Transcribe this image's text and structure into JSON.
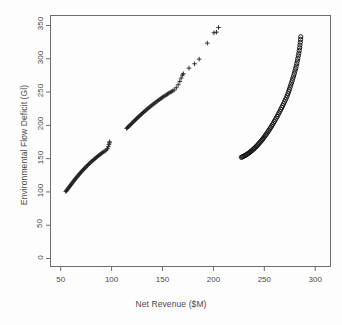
{
  "chart_data": {
    "type": "scatter",
    "title": "",
    "xlabel": "Net Revenue ($M)",
    "ylabel": "Environmental Flow Deficit (Gl)",
    "xlim": [
      40,
      315
    ],
    "ylim": [
      -12,
      365
    ],
    "xticks": [
      50,
      100,
      150,
      200,
      250,
      300
    ],
    "yticks": [
      0,
      50,
      100,
      150,
      200,
      250,
      300,
      350
    ],
    "grid": false,
    "legend": null,
    "box": true,
    "series": [
      {
        "name": "lower-left-front",
        "marker": "plus",
        "color": "#202020",
        "points": [
          [
            55.0,
            100.5
          ],
          [
            55.6,
            101.8
          ],
          [
            56.2,
            103.0
          ],
          [
            56.9,
            104.3
          ],
          [
            57.5,
            105.6
          ],
          [
            58.1,
            106.9
          ],
          [
            58.8,
            108.2
          ],
          [
            59.4,
            109.5
          ],
          [
            60.0,
            110.8
          ],
          [
            60.7,
            112.1
          ],
          [
            61.3,
            113.4
          ],
          [
            62.0,
            114.7
          ],
          [
            62.6,
            116.0
          ],
          [
            63.3,
            117.3
          ],
          [
            63.9,
            118.6
          ],
          [
            64.6,
            119.9
          ],
          [
            65.3,
            121.2
          ],
          [
            66.0,
            122.5
          ],
          [
            66.7,
            123.8
          ],
          [
            67.4,
            125.0
          ],
          [
            68.1,
            126.3
          ],
          [
            68.8,
            127.5
          ],
          [
            69.5,
            128.8
          ],
          [
            70.2,
            130.0
          ],
          [
            71.0,
            131.3
          ],
          [
            71.7,
            132.5
          ],
          [
            72.5,
            133.8
          ],
          [
            73.2,
            135.0
          ],
          [
            74.0,
            136.3
          ],
          [
            74.8,
            137.5
          ],
          [
            75.6,
            138.7
          ],
          [
            76.4,
            140.0
          ],
          [
            77.2,
            141.2
          ],
          [
            78.0,
            142.4
          ],
          [
            78.9,
            143.6
          ],
          [
            79.7,
            144.8
          ],
          [
            80.6,
            146.0
          ],
          [
            81.5,
            147.2
          ],
          [
            82.4,
            148.4
          ],
          [
            83.3,
            149.6
          ],
          [
            84.2,
            150.8
          ],
          [
            85.2,
            152.0
          ],
          [
            86.1,
            153.2
          ],
          [
            87.1,
            154.4
          ],
          [
            88.1,
            155.6
          ],
          [
            89.2,
            156.8
          ],
          [
            90.2,
            158.0
          ],
          [
            91.3,
            159.2
          ],
          [
            92.4,
            160.4
          ],
          [
            93.6,
            161.6
          ],
          [
            94.8,
            163.0
          ],
          [
            96.0,
            165.0
          ],
          [
            96.8,
            168.0
          ],
          [
            97.4,
            171.0
          ],
          [
            97.8,
            173.5
          ],
          [
            98.1,
            175.2
          ]
        ]
      },
      {
        "name": "middle-front",
        "marker": "plus",
        "color": "#202020",
        "points": [
          [
            114.8,
            195.4
          ],
          [
            115.6,
            196.6
          ],
          [
            116.4,
            197.8
          ],
          [
            117.2,
            199.0
          ],
          [
            118.0,
            200.2
          ],
          [
            118.8,
            201.4
          ],
          [
            119.6,
            202.6
          ],
          [
            120.4,
            203.8
          ],
          [
            121.2,
            205.0
          ],
          [
            122.0,
            206.2
          ],
          [
            122.8,
            207.4
          ],
          [
            123.6,
            208.6
          ],
          [
            124.4,
            209.8
          ],
          [
            125.2,
            211.0
          ],
          [
            126.0,
            212.2
          ],
          [
            126.9,
            213.4
          ],
          [
            127.7,
            214.6
          ],
          [
            128.6,
            215.8
          ],
          [
            129.4,
            217.0
          ],
          [
            130.3,
            218.2
          ],
          [
            131.2,
            219.4
          ],
          [
            132.1,
            220.6
          ],
          [
            133.0,
            221.8
          ],
          [
            133.9,
            223.0
          ],
          [
            134.8,
            224.2
          ],
          [
            135.7,
            225.4
          ],
          [
            136.7,
            226.6
          ],
          [
            137.6,
            227.8
          ],
          [
            138.6,
            229.0
          ],
          [
            139.6,
            230.2
          ],
          [
            140.6,
            231.4
          ],
          [
            141.6,
            232.6
          ],
          [
            142.6,
            233.8
          ],
          [
            143.6,
            235.0
          ],
          [
            144.7,
            236.2
          ],
          [
            145.7,
            237.4
          ],
          [
            146.8,
            238.6
          ],
          [
            147.9,
            239.8
          ],
          [
            149.0,
            241.0
          ],
          [
            150.1,
            242.2
          ],
          [
            151.3,
            243.4
          ],
          [
            152.5,
            244.6
          ],
          [
            153.7,
            245.8
          ],
          [
            154.9,
            247.0
          ],
          [
            156.1,
            248.2
          ],
          [
            157.4,
            249.4
          ],
          [
            158.7,
            250.6
          ],
          [
            160.0,
            251.8
          ],
          [
            161.4,
            253.0
          ],
          [
            163.5,
            256.5
          ],
          [
            165.4,
            261.0
          ],
          [
            167.0,
            266.0
          ],
          [
            168.3,
            271.0
          ],
          [
            169.5,
            275.5
          ],
          [
            170.5,
            277.5
          ],
          [
            176.0,
            286.0
          ],
          [
            181.5,
            292.5
          ],
          [
            186.0,
            299.5
          ],
          [
            194.0,
            323.5
          ],
          [
            200.5,
            339.0
          ],
          [
            203.0,
            340.0
          ],
          [
            205.0,
            347.0
          ]
        ]
      },
      {
        "name": "right-front",
        "marker": "circle",
        "color": "#151515",
        "points": [
          [
            227.5,
            152.0
          ],
          [
            228.4,
            152.6
          ],
          [
            229.3,
            153.3
          ],
          [
            230.2,
            154.0
          ],
          [
            231.1,
            154.8
          ],
          [
            232.0,
            155.6
          ],
          [
            232.9,
            156.5
          ],
          [
            233.8,
            157.4
          ],
          [
            234.7,
            158.4
          ],
          [
            235.6,
            159.4
          ],
          [
            236.5,
            160.5
          ],
          [
            237.4,
            161.6
          ],
          [
            238.3,
            162.8
          ],
          [
            239.2,
            164.0
          ],
          [
            240.1,
            165.3
          ],
          [
            241.0,
            166.6
          ],
          [
            241.9,
            168.0
          ],
          [
            242.8,
            169.4
          ],
          [
            243.7,
            170.9
          ],
          [
            244.6,
            172.4
          ],
          [
            245.5,
            174.0
          ],
          [
            246.4,
            175.6
          ],
          [
            247.3,
            177.3
          ],
          [
            248.2,
            179.0
          ],
          [
            249.1,
            180.8
          ],
          [
            250.0,
            182.6
          ],
          [
            250.9,
            184.5
          ],
          [
            251.8,
            186.4
          ],
          [
            252.7,
            188.4
          ],
          [
            253.6,
            190.4
          ],
          [
            254.5,
            192.5
          ],
          [
            255.4,
            194.6
          ],
          [
            256.3,
            196.8
          ],
          [
            257.2,
            199.0
          ],
          [
            258.1,
            201.3
          ],
          [
            259.0,
            203.6
          ],
          [
            259.9,
            206.0
          ],
          [
            260.8,
            208.4
          ],
          [
            261.7,
            210.9
          ],
          [
            262.6,
            213.4
          ],
          [
            263.5,
            216.0
          ],
          [
            264.4,
            218.6
          ],
          [
            265.3,
            221.3
          ],
          [
            266.2,
            224.0
          ],
          [
            267.1,
            226.8
          ],
          [
            268.0,
            229.6
          ],
          [
            268.9,
            232.5
          ],
          [
            269.8,
            235.4
          ],
          [
            270.7,
            238.4
          ],
          [
            271.6,
            241.4
          ],
          [
            272.5,
            244.5
          ],
          [
            273.2,
            247.6
          ],
          [
            273.9,
            250.8
          ],
          [
            274.6,
            254.0
          ],
          [
            275.3,
            257.3
          ],
          [
            276.0,
            260.6
          ],
          [
            276.7,
            264.0
          ],
          [
            277.4,
            267.4
          ],
          [
            278.1,
            270.9
          ],
          [
            278.8,
            274.4
          ],
          [
            279.5,
            278.0
          ],
          [
            280.1,
            281.6
          ],
          [
            280.7,
            285.3
          ],
          [
            281.3,
            289.0
          ],
          [
            281.9,
            292.8
          ],
          [
            282.4,
            296.6
          ],
          [
            282.9,
            300.5
          ],
          [
            283.4,
            304.4
          ],
          [
            283.9,
            308.4
          ],
          [
            284.3,
            312.4
          ],
          [
            284.7,
            316.5
          ],
          [
            285.0,
            320.6
          ],
          [
            285.3,
            324.8
          ],
          [
            285.6,
            329.0
          ],
          [
            285.8,
            333.0
          ]
        ]
      }
    ]
  }
}
